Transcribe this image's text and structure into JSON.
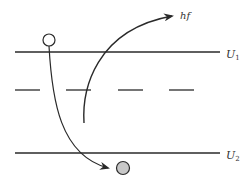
{
  "diagram": {
    "type": "energy-level-transition",
    "levels": [
      {
        "id": "upper",
        "label": "U",
        "subscript": "1",
        "style": "solid",
        "y": 52
      },
      {
        "id": "intermediate",
        "label": "",
        "style": "dashed",
        "y": 90
      },
      {
        "id": "lower",
        "label": "U",
        "subscript": "2",
        "style": "solid",
        "y": 153
      }
    ],
    "photon": {
      "label": "hf",
      "direction": "emitted-upward"
    },
    "particles": [
      {
        "id": "initial",
        "state": "open",
        "fill": "#ffffff",
        "position": "above-upper-level"
      },
      {
        "id": "final",
        "state": "filled",
        "fill": "#c8c8c8",
        "position": "below-lower-level"
      }
    ],
    "colors": {
      "line": "#2a2a2a",
      "text": "#333333",
      "background": "#ffffff"
    }
  }
}
